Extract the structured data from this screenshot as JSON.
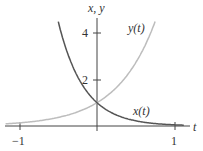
{
  "chart_data": {
    "type": "line",
    "title": "",
    "xlabel": "t",
    "ylabel": "x, y",
    "xlim": [
      -1.1,
      1.1
    ],
    "ylim": [
      0,
      4.6
    ],
    "x_ticks": [
      {
        "value": -1,
        "label": "−1"
      },
      {
        "value": 1,
        "label": "1"
      }
    ],
    "y_ticks": [
      {
        "value": 2,
        "label": "2"
      },
      {
        "value": 4,
        "label": "4"
      }
    ],
    "grid": false,
    "series": [
      {
        "name": "x(t)",
        "formula": "e^(-3t)",
        "color": "#555555",
        "x": [
          -0.5,
          -0.4,
          -0.3,
          -0.2,
          -0.1,
          0,
          0.2,
          0.4,
          0.6,
          0.8,
          1.0,
          1.1
        ],
        "values": [
          4.48,
          3.32,
          2.46,
          1.82,
          1.35,
          1.0,
          0.55,
          0.3,
          0.17,
          0.09,
          0.05,
          0.04
        ]
      },
      {
        "name": "y(t)",
        "formula": "e^(2t)",
        "color": "#bbbbbb",
        "x": [
          -1.1,
          -1.0,
          -0.8,
          -0.6,
          -0.4,
          -0.2,
          0,
          0.2,
          0.4,
          0.6,
          0.75
        ],
        "values": [
          0.11,
          0.14,
          0.2,
          0.3,
          0.45,
          0.67,
          1.0,
          1.49,
          2.23,
          3.32,
          4.48
        ]
      }
    ]
  },
  "labels": {
    "yaxis": "x, y",
    "xaxis": "t",
    "tick_y4": "4",
    "tick_y2": "2",
    "tick_xm1": "−1",
    "tick_x1": "1",
    "series_y": "y(t)",
    "series_x": "x(t)"
  }
}
